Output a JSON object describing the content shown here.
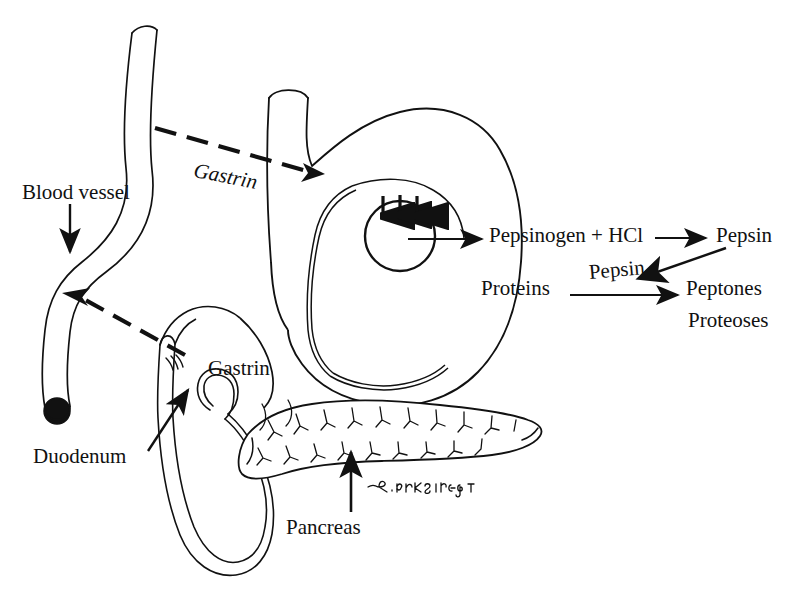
{
  "figure": {
    "signature": "R. KIRKSEY",
    "background_color": "#ffffff",
    "ink_color": "#111111"
  },
  "labels": {
    "blood_vessel": "Blood vessel",
    "duodenum": "Duodenum",
    "pancreas": "Pancreas",
    "gastrin_upper": "Gastrin",
    "gastrin_lower": "Gastrin"
  },
  "reactions": {
    "pepsinogen": "Pepsinogen + HCl",
    "pepsin_product": "Pepsin",
    "proteins": "Proteins",
    "pepsin_catalyst": "Pepsin",
    "peptones": "Peptones",
    "proteoses": "Proteoses"
  }
}
